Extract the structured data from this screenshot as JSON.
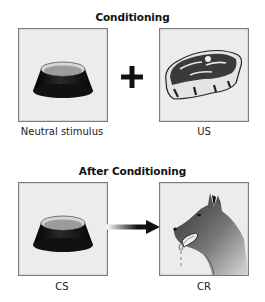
{
  "diagram": {
    "top_section": {
      "title": "Conditioning",
      "left_panel": {
        "label": "Neutral stimulus",
        "icon": "dog-bowl-icon"
      },
      "connector": {
        "symbol": "+",
        "icon": "plus-icon"
      },
      "right_panel": {
        "label": "US",
        "icon": "steak-icon"
      }
    },
    "bottom_section": {
      "title": "After Conditioning",
      "left_panel": {
        "label": "CS",
        "icon": "dog-bowl-icon"
      },
      "connector": {
        "symbol": "→",
        "icon": "arrow-right-icon"
      },
      "right_panel": {
        "label": "CR",
        "icon": "salivating-dog-icon"
      }
    },
    "colors": {
      "panel_bg": "#ececec",
      "panel_border": "#7a7a7a",
      "bowl_body": "#1a1a1a",
      "bowl_inner": "#9c9c9c",
      "meat": "#3a3a3a",
      "fat": "#e4e4e4",
      "arrow": "#111111"
    }
  }
}
